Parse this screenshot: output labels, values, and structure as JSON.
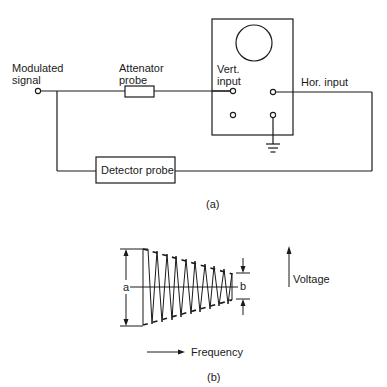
{
  "figure_a": {
    "caption": "(a)",
    "labels": {
      "modulated_line1": "Modulated",
      "modulated_line2": "signal",
      "attenuator_line1": "Attenator",
      "attenuator_line2": "probe",
      "vert_line1": "Vert.",
      "vert_line2": "input",
      "hor_input": "Hor. input",
      "detector_probe": "Detector probe"
    },
    "components": [
      "modulated-signal-terminal",
      "attenuator-probe-resistor",
      "oscilloscope",
      "crt-screen",
      "vertical-input-terminal",
      "horizontal-input-terminal",
      "ground-terminal",
      "detector-probe-box"
    ]
  },
  "figure_b": {
    "caption": "(b)",
    "labels": {
      "a": "a",
      "b": "b",
      "voltage": "Voltage",
      "frequency": "Frequency"
    },
    "waveform": {
      "cycles": 9,
      "start_amplitude_label": "a",
      "end_amplitude_label": "b",
      "envelope": "linearly decreasing with frequency"
    }
  },
  "colors": {
    "ink": "#1a1a1a",
    "background": "#ffffff"
  }
}
